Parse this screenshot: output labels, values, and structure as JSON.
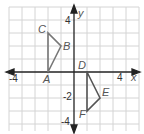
{
  "diagram": {
    "type": "coordinate-plane",
    "axes": {
      "x_label": "x",
      "y_label": "y",
      "x_ticks": [
        {
          "value": -4,
          "text": "-4"
        },
        {
          "value": 4,
          "text": "4"
        }
      ],
      "y_ticks": [
        {
          "value": 4,
          "text": "4"
        },
        {
          "value": 2,
          "text": "2"
        },
        {
          "value": -2,
          "text": "-2"
        },
        {
          "value": -4,
          "text": "-4"
        }
      ],
      "range": {
        "x": [
          -5,
          5
        ],
        "y": [
          -5,
          5
        ]
      }
    },
    "origin_label": "D",
    "triangles": [
      {
        "name": "ABC",
        "color": "#777777",
        "vertices": [
          {
            "label": "A",
            "x": -2,
            "y": 0
          },
          {
            "label": "B",
            "x": -1,
            "y": 2
          },
          {
            "label": "C",
            "x": -2,
            "y": 3
          }
        ]
      },
      {
        "name": "DEF",
        "color": "#555555",
        "vertices": [
          {
            "label": "D",
            "x": 1,
            "y": 0
          },
          {
            "label": "E",
            "x": 2,
            "y": -2
          },
          {
            "label": "F",
            "x": 1,
            "y": -3
          }
        ]
      }
    ],
    "colors": {
      "grid": "#d0d0d0",
      "axis": "#222222"
    }
  }
}
